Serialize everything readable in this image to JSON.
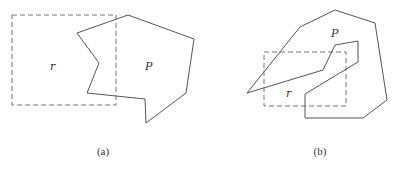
{
  "figures": [
    {
      "caption": "(a)",
      "region_label": "r",
      "polygon_label": "P",
      "region_rect": {
        "x": 12,
        "y": 15,
        "w": 104,
        "h": 90
      },
      "polygon_points": "77,33 128,15 194,39 186,93 146,123 145,99 87,93 99,63",
      "label_positions": {
        "r": [
          50,
          70
        ],
        "P": [
          145,
          70
        ],
        "caption": [
          103,
          155
        ]
      }
    },
    {
      "caption": "(b)",
      "region_label": "r",
      "polygon_label": "P",
      "region_rect": {
        "x": 264,
        "y": 52,
        "w": 82,
        "h": 54
      },
      "polygon_points": "247,93 300,27 335,10 375,23 387,100 363,118 305,118 305,94 358,62 358,41 335,45 323,70",
      "label_positions": {
        "r": [
          286,
          97
        ],
        "P": [
          331,
          37
        ],
        "caption": [
          320,
          155
        ]
      }
    }
  ],
  "colors": {
    "line": "#555555",
    "dash": "#777777"
  }
}
